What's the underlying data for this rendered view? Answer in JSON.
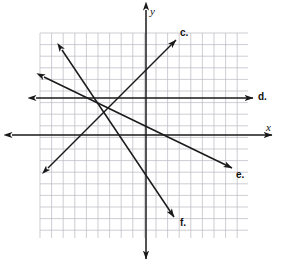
{
  "figure": {
    "background_color": "#ffffff",
    "width": 283,
    "height": 272
  },
  "axes": {
    "x_axis": {
      "label": "x",
      "label_position": {
        "x": 266,
        "y": 122
      },
      "color": "#1a1a1a",
      "y_pixel": 135,
      "x_start": 12,
      "x_end": 272,
      "arrows": "both"
    },
    "y_axis": {
      "label": "y",
      "label_position": {
        "x": 150,
        "y": 6
      },
      "color": "#1a1a1a",
      "x_pixel": 146,
      "y_start": 10,
      "y_end": 259,
      "arrows": "both"
    }
  },
  "grid": {
    "color": "#b9b9c2",
    "left": 40,
    "top": 33,
    "right": 248,
    "bottom": 238,
    "cell_size": 11.6,
    "columns": 18,
    "rows": 18,
    "visible": true
  },
  "chart_data": {
    "type": "line",
    "xlabel": "x",
    "ylabel": "y",
    "grid": true,
    "legend_position": "inline-end-labels",
    "origin_pixel": {
      "x": 146,
      "y": 135
    },
    "unit_pixels": 11.6,
    "xlim": [
      -9.1,
      8.8
    ],
    "ylim": [
      -8.9,
      8.8
    ],
    "series": [
      {
        "name": "c",
        "label": "c.",
        "label_position": {
          "x": 180,
          "y": 28
        },
        "color": "#1a1a1a",
        "arrows": "both",
        "slope": 0.82,
        "intercept": 1.3,
        "pixel_start": {
          "x": 48,
          "y": 168
        },
        "pixel_end": {
          "x": 176,
          "y": 40
        },
        "points": [
          [
            -8.4,
            -2.8
          ],
          [
            2.6,
            8.2
          ]
        ]
      },
      {
        "name": "d",
        "label": "d.",
        "label_position": {
          "x": 258,
          "y": 92
        },
        "color": "#1a1a1a",
        "arrows": "both",
        "slope": 0,
        "intercept": 3.2,
        "pixel_start": {
          "x": 36,
          "y": 98
        },
        "pixel_end": {
          "x": 253,
          "y": 98
        },
        "points": [
          [
            -9.5,
            3.2
          ],
          [
            9.2,
            3.2
          ]
        ]
      },
      {
        "name": "e",
        "label": "e.",
        "label_position": {
          "x": 236,
          "y": 170
        },
        "color": "#1a1a1a",
        "arrows": "both",
        "slope": -0.48,
        "intercept": -0.7,
        "pixel_start": {
          "x": 44,
          "y": 77
        },
        "pixel_end": {
          "x": 232,
          "y": 168
        },
        "points": [
          [
            -8.8,
            5.0
          ],
          [
            7.4,
            -2.8
          ]
        ]
      },
      {
        "name": "f",
        "label": "f.",
        "label_position": {
          "x": 180,
          "y": 218
        },
        "color": "#1a1a1a",
        "arrows": "both",
        "slope": -1.49,
        "intercept": 0.8,
        "pixel_start": {
          "x": 62,
          "y": 50
        },
        "pixel_end": {
          "x": 174,
          "y": 217
        },
        "points": [
          [
            -7.2,
            7.3
          ],
          [
            2.4,
            -7.1
          ]
        ]
      }
    ]
  }
}
